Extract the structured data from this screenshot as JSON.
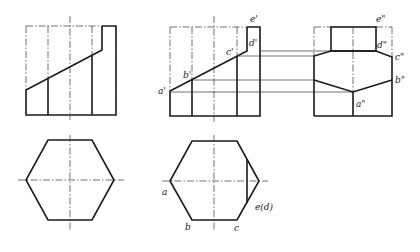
{
  "figure": {
    "type": "orthographic-projection",
    "views": {
      "left_front": {
        "description": "Hexagonal prism front view, truncated by inclined plane"
      },
      "middle_front": {
        "labels": {
          "a": "a'",
          "b": "b'",
          "c": "c'",
          "d": "d'",
          "e": "e'"
        }
      },
      "right_side": {
        "labels": {
          "a": "a\"",
          "b": "b\"",
          "c": "c\"",
          "d": "d\"",
          "e": "e\""
        }
      },
      "left_top": {
        "description": "Hexagon top view"
      },
      "middle_top": {
        "labels": {
          "a": "a",
          "b": "b",
          "c": "c",
          "ed": "e(d)"
        }
      }
    }
  }
}
